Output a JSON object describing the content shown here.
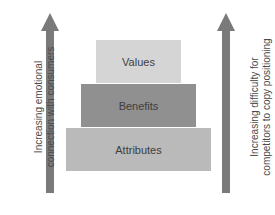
{
  "diagram": {
    "type": "pyramid",
    "tiers": [
      {
        "label": "Values",
        "color": "#d5d5d5"
      },
      {
        "label": "Benefits",
        "color": "#909090"
      },
      {
        "label": "Attributes",
        "color": "#bababa"
      }
    ],
    "left_arrow": {
      "direction": "up",
      "color": "#7a7a7a",
      "label_line1": "Increasing emotional",
      "label_line2": "connection with consumers"
    },
    "right_arrow": {
      "direction": "up",
      "color": "#7a7a7a",
      "label_line1": "Increasing difficulty for",
      "label_line2": "competitors to copy positioning"
    }
  }
}
